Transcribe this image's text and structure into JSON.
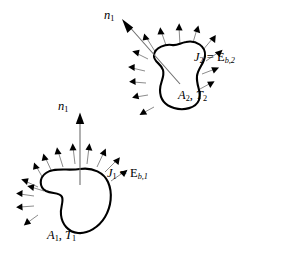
{
  "figure": {
    "type": "diagram",
    "background_color": "#ffffff",
    "line_color": "#000000",
    "ray_color": "#8c8c8c",
    "normal_color": "#6e6e6e",
    "width": 288,
    "height": 258
  },
  "surfaces": [
    {
      "id": "surface-2",
      "position": "upper-right",
      "normal_label": {
        "symbol": "n",
        "subscript": "1"
      },
      "radiosity_label": {
        "symbol": "J",
        "subscript": "2",
        "equals": "=",
        "rhs_symbol": "E",
        "rhs_subscript": "b,2",
        "full_text": "J2 = Eb,2"
      },
      "area_temp_label": {
        "area_symbol": "A",
        "area_subscript": "2",
        "separator": ",",
        "temp_symbol": "T",
        "temp_subscript": "2",
        "full_text": "A2, T2"
      },
      "emission_ray_count": 14
    },
    {
      "id": "surface-1",
      "position": "lower-left",
      "normal_label": {
        "symbol": "n",
        "subscript": "1"
      },
      "radiosity_label": {
        "symbol": "J",
        "subscript": "1",
        "equals": "=",
        "rhs_symbol": "E",
        "rhs_subscript": "b,1",
        "full_text": "J1 = Eb,1"
      },
      "area_temp_label": {
        "area_symbol": "A",
        "area_subscript": "1",
        "separator": ",",
        "temp_symbol": "T",
        "temp_subscript": "1",
        "full_text": "A1, T1"
      },
      "emission_ray_count": 13
    }
  ]
}
